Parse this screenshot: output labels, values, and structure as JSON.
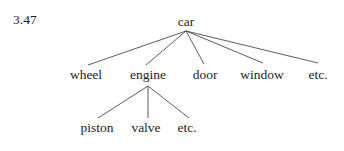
{
  "figure": {
    "number": "3.47",
    "type": "tree-diagram",
    "line_color": "#4a4a4a",
    "text_color": "#1d1d1d",
    "background_color": "#ffffff"
  },
  "tree": {
    "root": {
      "label": "car",
      "x": 186,
      "y": 26
    },
    "level2": [
      {
        "label": "wheel",
        "x": 86,
        "y": 79
      },
      {
        "label": "engine",
        "x": 148,
        "y": 79
      },
      {
        "label": "door",
        "x": 205,
        "y": 79
      },
      {
        "label": "window",
        "x": 262,
        "y": 79
      },
      {
        "label": "etc.",
        "x": 318,
        "y": 79
      }
    ],
    "level3": [
      {
        "label": "piston",
        "x": 97,
        "y": 132
      },
      {
        "label": "valve",
        "x": 146,
        "y": 132
      },
      {
        "label": "etc.",
        "x": 187,
        "y": 132
      }
    ],
    "edges_from_root": [
      {
        "x1": 186,
        "y1": 31,
        "x2": 88,
        "y2": 65
      },
      {
        "x1": 186,
        "y1": 31,
        "x2": 146,
        "y2": 65
      },
      {
        "x1": 186,
        "y1": 31,
        "x2": 204,
        "y2": 64
      },
      {
        "x1": 186,
        "y1": 31,
        "x2": 263,
        "y2": 63
      },
      {
        "x1": 186,
        "y1": 31,
        "x2": 318,
        "y2": 63
      }
    ],
    "edges_from_engine": [
      {
        "x1": 148,
        "y1": 86,
        "x2": 98,
        "y2": 118
      },
      {
        "x1": 148,
        "y1": 86,
        "x2": 148,
        "y2": 118
      },
      {
        "x1": 148,
        "y1": 86,
        "x2": 189,
        "y2": 118
      }
    ]
  }
}
